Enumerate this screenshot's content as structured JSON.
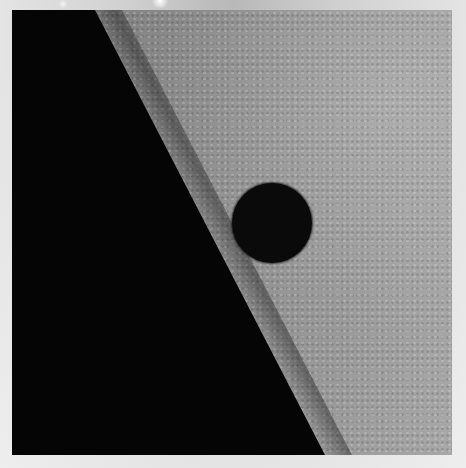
{
  "image": {
    "description": "Dark circular planet disk transiting in front of a textured solar surface near the solar limb, with black space on the left",
    "colors": {
      "space": "#050505",
      "solar_surface": "#8c8c8c",
      "planet": "#0a0a0a",
      "border": "#dcdcdc"
    },
    "planet_disk": {
      "center_x": 271,
      "center_y": 223,
      "radius": 40
    }
  }
}
